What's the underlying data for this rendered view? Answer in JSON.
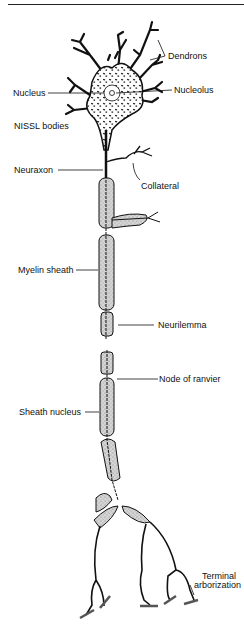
{
  "diagram": {
    "labels": {
      "dendrons": "Dendrons",
      "nucleus": "Nucleus",
      "nucleolus": "Nucleolus",
      "nissl_bodies": "NISSL bodies",
      "neuraxon": "Neuraxon",
      "collateral": "Collateral",
      "myelin_sheath": "Myelin sheath",
      "neurilemma": "Neurilemma",
      "node_of_ranvier": "Node of ranvier",
      "sheath_nucleus": "Sheath nucleus",
      "terminal_arborization_1": "Terminal",
      "terminal_arborization_2": "arborization"
    },
    "colors": {
      "ink": "#111111",
      "sheath_fill": "#d9d9d9",
      "background": "#ffffff"
    }
  }
}
